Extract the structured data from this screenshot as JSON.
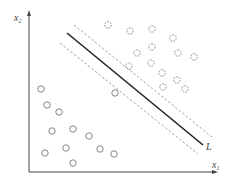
{
  "diagram": {
    "type": "svm-separating-hyperplane",
    "axes": {
      "x_label": "x",
      "x_sub": "1",
      "y_label": "x",
      "y_sub": "2",
      "origin": [
        29,
        172
      ],
      "x_end": [
        214,
        172
      ],
      "y_end": [
        29,
        14
      ]
    },
    "lines": {
      "decision_boundary": {
        "label": "L",
        "from": [
          67,
          33
        ],
        "to": [
          203,
          145
        ],
        "color": "#222222"
      },
      "upper_margin": {
        "from": [
          74,
          25
        ],
        "to": [
          212,
          137
        ],
        "color": "#888888"
      },
      "lower_margin": {
        "from": [
          60,
          43
        ],
        "to": [
          198,
          154
        ],
        "color": "#888888"
      }
    },
    "classes": {
      "positive": {
        "style": "dashed-circle",
        "points": [
          [
            108,
            25
          ],
          [
            130,
            31
          ],
          [
            152,
            29
          ],
          [
            173,
            38
          ],
          [
            152,
            47
          ],
          [
            137,
            53
          ],
          [
            178,
            53
          ],
          [
            194,
            57
          ],
          [
            151,
            63
          ],
          [
            129,
            66
          ],
          [
            162,
            73
          ],
          [
            177,
            80
          ],
          [
            163,
            87
          ],
          [
            185,
            89
          ]
        ]
      },
      "negative": {
        "style": "solid-circle",
        "points": [
          [
            41,
            89
          ],
          [
            115,
            93
          ],
          [
            47,
            105
          ],
          [
            59,
            112
          ],
          [
            52,
            131
          ],
          [
            73,
            129
          ],
          [
            89,
            136
          ],
          [
            45,
            153
          ],
          [
            66,
            148
          ],
          [
            100,
            149
          ],
          [
            114,
            154
          ],
          [
            73,
            163
          ]
        ]
      }
    },
    "colors": {
      "axis": "#444444",
      "circle": "#777777"
    }
  }
}
